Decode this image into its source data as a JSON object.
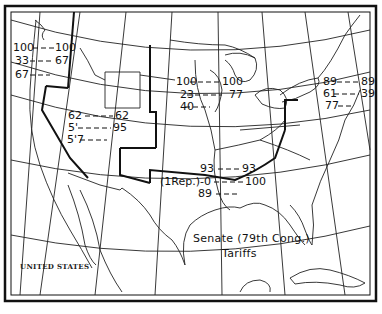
{
  "map": {
    "title_line1": "Senate (79th Cong.)",
    "title_line2": "Tariffs",
    "country_label": "UNITED STATES",
    "colors": {
      "ink": "#111111",
      "paper": "#ffffff"
    },
    "regions": [
      {
        "name": "Pacific Northwest",
        "rows": [
          {
            "left": "100",
            "right": "100"
          },
          {
            "left": "33",
            "right": "67"
          },
          {
            "left": "67",
            "right": ""
          }
        ]
      },
      {
        "name": "Mountain",
        "rows": [
          {
            "left": "62",
            "right": "62"
          },
          {
            "left": "5'",
            "right": "95"
          },
          {
            "left": "5'7",
            "right": ""
          }
        ]
      },
      {
        "name": "Midwest",
        "rows": [
          {
            "left": "100",
            "right": "100"
          },
          {
            "left": "23",
            "right": "77"
          },
          {
            "left": "40",
            "right": ""
          }
        ]
      },
      {
        "name": "Northeast",
        "rows": [
          {
            "left": "89",
            "right": "89"
          },
          {
            "left": "61",
            "right": "39"
          },
          {
            "left": "77",
            "right": ""
          }
        ]
      },
      {
        "name": "South",
        "rows": [
          {
            "left": "93",
            "right": "93"
          },
          {
            "left": "(1Rep.)-0",
            "right": "100"
          },
          {
            "left": "89",
            "right": ""
          }
        ]
      }
    ]
  }
}
